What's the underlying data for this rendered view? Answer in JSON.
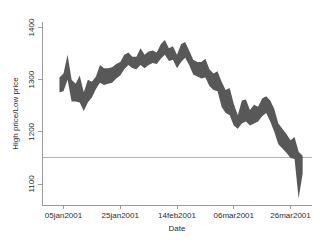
{
  "chart_data": {
    "type": "area",
    "title": "",
    "subtitle": "",
    "xlabel": "Date",
    "ylabel": "High price/Low price",
    "ylim": [
      1050,
      1420
    ],
    "xlim": [
      0,
      60
    ],
    "grid": false,
    "legend": null,
    "band_color": "#585858",
    "reference_line": {
      "y": 1150,
      "color": "#b0b0b0"
    },
    "y_ticks": [
      1100,
      1200,
      1300,
      1400
    ],
    "y_tick_labels": [
      "1100",
      "1200",
      "1300",
      "1400"
    ],
    "x_ticks": [
      1,
      15,
      29,
      43,
      57
    ],
    "x_tick_labels": [
      "05jan2001",
      "25jan2001",
      "14feb2001",
      "06mar2001",
      "26mar2001"
    ],
    "series": [
      {
        "name": "High price",
        "x": [
          0,
          1,
          2,
          3,
          4,
          5,
          6,
          7,
          8,
          9,
          10,
          11,
          12,
          13,
          14,
          15,
          16,
          17,
          18,
          19,
          20,
          21,
          22,
          23,
          24,
          25,
          26,
          27,
          28,
          29,
          30,
          31,
          32,
          33,
          34,
          35,
          36,
          37,
          38,
          39,
          40,
          41,
          42,
          43,
          44,
          45,
          46,
          47,
          48,
          49,
          50,
          51,
          52,
          53,
          54,
          55,
          56,
          57,
          58,
          59,
          60
        ],
        "values": [
          1304,
          1312,
          1348,
          1300,
          1292,
          1308,
          1276,
          1300,
          1296,
          1306,
          1328,
          1322,
          1322,
          1324,
          1330,
          1334,
          1348,
          1352,
          1344,
          1344,
          1360,
          1348,
          1354,
          1356,
          1352,
          1368,
          1376,
          1360,
          1364,
          1348,
          1368,
          1372,
          1356,
          1338,
          1334,
          1334,
          1340,
          1320,
          1312,
          1316,
          1296,
          1280,
          1284,
          1254,
          1232,
          1260,
          1262,
          1242,
          1252,
          1248,
          1264,
          1268,
          1260,
          1244,
          1216,
          1206,
          1196,
          1184,
          1190,
          1162,
          1154
        ]
      },
      {
        "name": "Low price",
        "x": [
          0,
          1,
          2,
          3,
          4,
          5,
          6,
          7,
          8,
          9,
          10,
          11,
          12,
          13,
          14,
          15,
          16,
          17,
          18,
          19,
          20,
          21,
          22,
          23,
          24,
          25,
          26,
          27,
          28,
          29,
          30,
          31,
          32,
          33,
          34,
          35,
          36,
          37,
          38,
          39,
          40,
          41,
          42,
          43,
          44,
          45,
          46,
          47,
          48,
          49,
          50,
          51,
          52,
          53,
          54,
          55,
          56,
          57,
          58,
          59,
          60
        ],
        "values": [
          1276,
          1278,
          1300,
          1258,
          1258,
          1256,
          1240,
          1256,
          1266,
          1282,
          1294,
          1290,
          1292,
          1294,
          1302,
          1308,
          1320,
          1328,
          1322,
          1320,
          1328,
          1322,
          1328,
          1332,
          1330,
          1340,
          1348,
          1336,
          1338,
          1322,
          1334,
          1342,
          1328,
          1310,
          1306,
          1302,
          1304,
          1288,
          1280,
          1278,
          1248,
          1236,
          1232,
          1212,
          1206,
          1216,
          1220,
          1212,
          1216,
          1220,
          1230,
          1236,
          1220,
          1200,
          1176,
          1168,
          1160,
          1150,
          1148,
          1072,
          1120
        ]
      }
    ]
  },
  "axis": {
    "y_title": "High price/Low price",
    "x_title": "Date"
  }
}
